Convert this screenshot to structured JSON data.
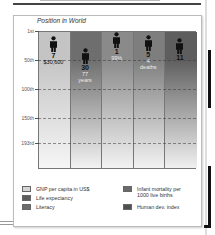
{
  "chart_data": {
    "type": "bar",
    "title": "Position in World",
    "ylabel": "Position in World",
    "y_ticks": [
      "1st",
      "50th",
      "100th",
      "150th",
      "193rd"
    ],
    "ylim": [
      1,
      193
    ],
    "y_inverted": true,
    "categories": [
      "GNP per capita in US$",
      "Life expectancy",
      "Literacy",
      "Infant mortality per 1000 live births",
      "Human dev. index"
    ],
    "series": [
      {
        "name": "Rank",
        "values": [
          7,
          30,
          1,
          5,
          11
        ]
      }
    ],
    "value_labels": [
      "$30,600",
      "77 years",
      "99%",
      "4 deaths",
      ""
    ],
    "colors": [
      "#d2d2d2",
      "#7a7a7a",
      "#9a9a9a",
      "#8c8c8c",
      "#6e6e6e"
    ],
    "grid": true,
    "legend_position": "bottom"
  },
  "panel": {
    "title": "Position in World"
  },
  "axis": {
    "ticks": [
      {
        "label": "1st",
        "y": 31
      },
      {
        "label": "50th",
        "y": 60
      },
      {
        "label": "100th",
        "y": 89
      },
      {
        "label": "150th",
        "y": 118
      },
      {
        "label": "193rd",
        "y": 143
      }
    ]
  },
  "columns": [
    {
      "rank": "7",
      "line1": "$30,600",
      "line2": "",
      "top_color": "#c4c4c4",
      "bottom_color": "#f6f6f6",
      "marker_top": 36,
      "light": false
    },
    {
      "rank": "30",
      "line1": "77",
      "line2": "years",
      "top_color": "#6e6e6e",
      "bottom_color": "#f2f2f2",
      "marker_top": 48,
      "light": true
    },
    {
      "rank": "1",
      "line1": "99%",
      "line2": "",
      "top_color": "#8a8a8a",
      "bottom_color": "#f2f2f2",
      "marker_top": 32,
      "light": true
    },
    {
      "rank": "5",
      "line1": "4",
      "line2": "deaths",
      "top_color": "#7e7e7e",
      "bottom_color": "#f2f2f2",
      "marker_top": 35,
      "light": true
    },
    {
      "rank": "11",
      "line1": "",
      "line2": "",
      "top_color": "#5e5e5e",
      "bottom_color": "#f0f0f0",
      "marker_top": 38,
      "light": true
    }
  ],
  "legend": {
    "items": [
      {
        "label": "GNP per capita in US$",
        "color": "#d4d4d4"
      },
      {
        "label": "Life expectancy",
        "color": "#5e5e5e"
      },
      {
        "label": "Literacy",
        "color": "#6c6c6c"
      },
      {
        "label": "Infant mortality per",
        "label2": "1000 live births",
        "color": "#6a6a6a"
      },
      {
        "label": "Human dev. index",
        "color": "#505050"
      }
    ]
  }
}
